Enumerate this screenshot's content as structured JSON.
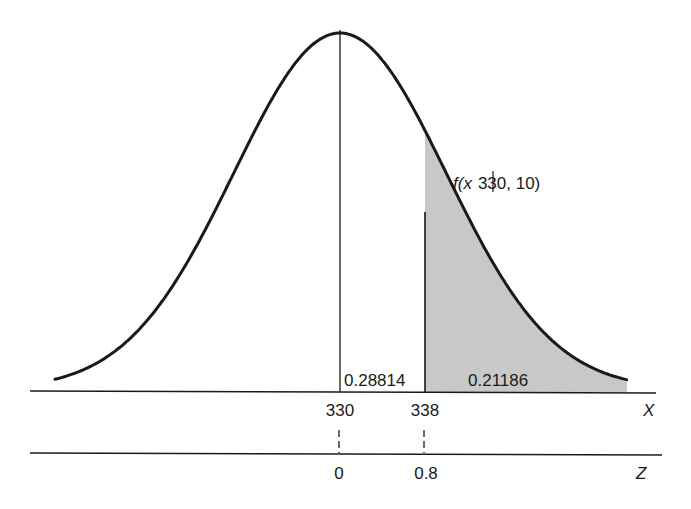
{
  "chart_data": {
    "type": "area",
    "title": "",
    "distribution": "normal",
    "mean": 330,
    "std": 10,
    "curve_label_prefix": "f(",
    "curve_label_var": "x",
    "curve_label_params": "330, 10)",
    "x_axis": {
      "label": "X",
      "ticks": [
        "330",
        "338"
      ],
      "tick_values": [
        330,
        338
      ]
    },
    "z_axis": {
      "label": "Z",
      "ticks": [
        "0",
        "0.8"
      ],
      "tick_values": [
        0,
        0.8
      ]
    },
    "regions": [
      {
        "name": "mean-to-338",
        "from": 330,
        "to": 338,
        "area": "0.28814",
        "shaded": false
      },
      {
        "name": "upper-tail",
        "from": 338,
        "to": "inf",
        "area": "0.21186",
        "shaded": true
      }
    ],
    "fill_color": "#c8c8c8",
    "line_color": "#1a1a1a"
  }
}
